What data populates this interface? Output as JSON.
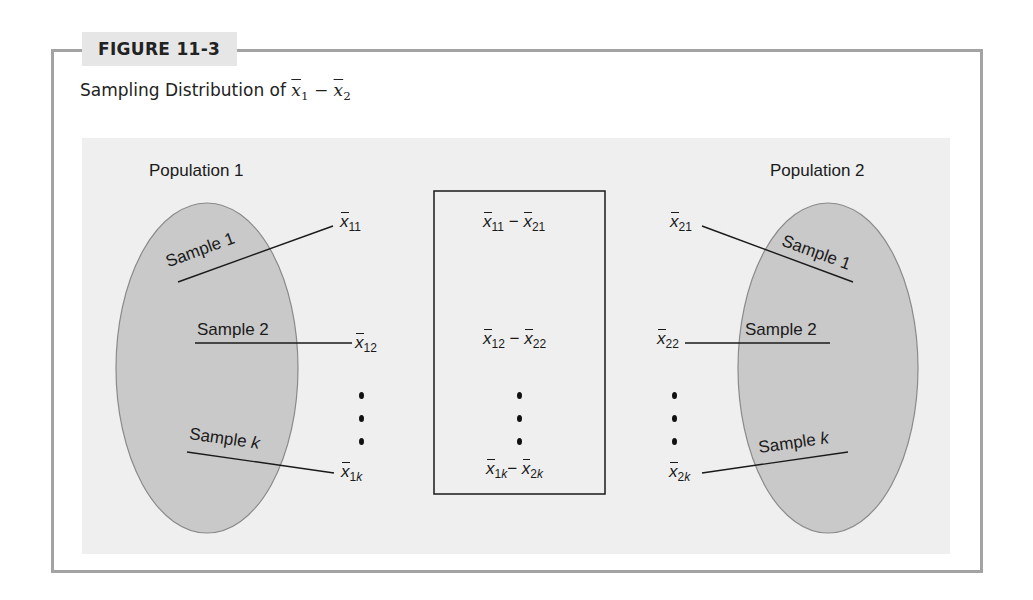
{
  "figure": {
    "label": "FIGURE 11-3",
    "caption_prefix": "Sampling Distribution of ",
    "caption_math": {
      "a": "x",
      "a_sub": "1",
      "op": " − ",
      "b": "x",
      "b_sub": "2"
    }
  },
  "population1": {
    "title": "Population 1",
    "samples": [
      "Sample 1",
      "Sample 2",
      "Sample k"
    ],
    "means": [
      {
        "sym": "x",
        "sub": "11"
      },
      {
        "sym": "x",
        "sub": "12"
      },
      {
        "sym": "x",
        "sub": "1",
        "sub_italic": "k"
      }
    ]
  },
  "population2": {
    "title": "Population 2",
    "samples": [
      "Sample 1",
      "Sample 2",
      "Sample k"
    ],
    "means": [
      {
        "sym": "x",
        "sub": "21"
      },
      {
        "sym": "x",
        "sub": "22"
      },
      {
        "sym": "x",
        "sub": "2",
        "sub_italic": "k"
      }
    ]
  },
  "differences": {
    "rows": [
      {
        "a_sub": "11",
        "b_sub": "21",
        "op": "−"
      },
      {
        "a_sub": "12",
        "b_sub": "22",
        "op": "−"
      },
      {
        "a_sub": "1",
        "a_sub_italic": "k",
        "b_sub": "2",
        "b_sub_italic": "k",
        "op": "−"
      }
    ],
    "ellipsis": "⋮"
  },
  "sample_word": "Sample",
  "k": "k",
  "colors": {
    "frame": "#a3a3a3",
    "tab_bg": "#e6e6e6",
    "panel_bg": "#efefef",
    "ellipse_fill": "#c9c9c9",
    "ellipse_stroke": "#8a8a8a",
    "line": "#1a1a1a"
  }
}
